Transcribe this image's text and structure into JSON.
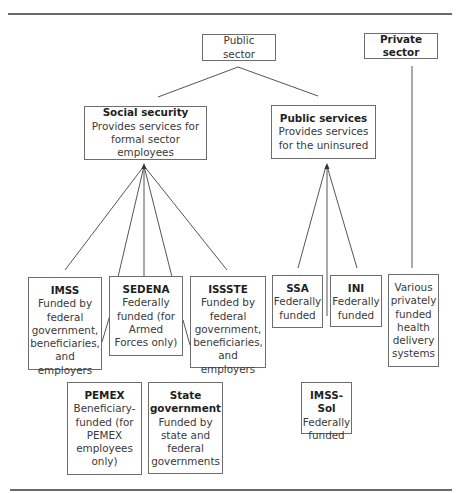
{
  "diagram": {
    "nodes": {
      "public_sector": {
        "title": "Public sector",
        "desc": ""
      },
      "private_sector": {
        "title": "Private sector",
        "desc": ""
      },
      "social_security": {
        "title": "Social security",
        "desc": "Provides services for formal sector employees"
      },
      "public_services": {
        "title": "Public services",
        "desc": "Provides services for the uninsured"
      },
      "imss": {
        "title": "IMSS",
        "desc": "Funded by federal government, beneficiaries, and employers"
      },
      "sedena": {
        "title": "SEDENA",
        "desc": "Federally funded (for Armed Forces only)"
      },
      "issste": {
        "title": "ISSSTE",
        "desc": "Funded by federal government, beneficiaries, and employers"
      },
      "ssa": {
        "title": "SSA",
        "desc": "Federally funded"
      },
      "ini": {
        "title": "INI",
        "desc": "Federally funded"
      },
      "private_systems": {
        "title": "",
        "desc": "Various privately funded health delivery systems"
      },
      "pemex": {
        "title": "PEMEX",
        "desc": "Beneficiary-funded (for PEMEX employees only)"
      },
      "state_government": {
        "title": "State government",
        "desc": "Funded by state and federal governments"
      },
      "imss_sol": {
        "title": "IMSS-Sol",
        "desc": "Federally funded"
      }
    },
    "edges": [
      [
        "public_sector",
        "social_security"
      ],
      [
        "public_sector",
        "public_services"
      ],
      [
        "social_security",
        "imss"
      ],
      [
        "social_security",
        "sedena"
      ],
      [
        "social_security",
        "issste"
      ],
      [
        "public_services",
        "ssa"
      ],
      [
        "public_services",
        "ini"
      ],
      [
        "private_sector",
        "private_systems"
      ]
    ],
    "colors": {
      "line": "#555555",
      "border": "#6d6d6d",
      "text": "#3a3a3a"
    }
  }
}
